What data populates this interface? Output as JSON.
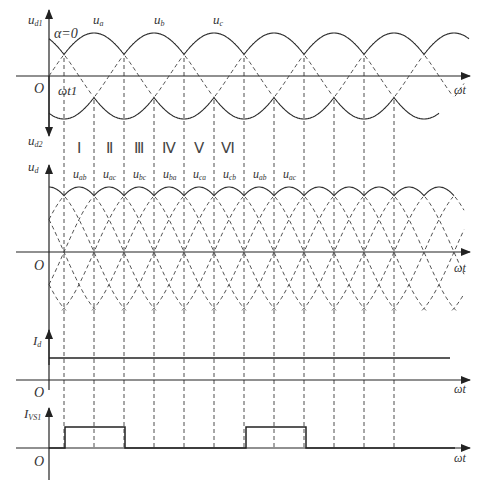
{
  "figure": {
    "panels": [
      {
        "id": "ud1_ud2",
        "y_label_top": "u",
        "y_label_top_sub": "d1",
        "y_label_bottom": "u",
        "y_label_bottom_sub": "d2",
        "origin": "O",
        "x_label": "ωt",
        "alpha_label": "α=0",
        "omega_t1_label": "ωt1",
        "phase_labels": [
          {
            "text": "u",
            "sub": "a"
          },
          {
            "text": "u",
            "sub": "b"
          },
          {
            "text": "u",
            "sub": "c"
          }
        ]
      },
      {
        "id": "ud",
        "y_label": "u",
        "y_label_sub": "d",
        "origin": "O",
        "x_label": "ωt",
        "intervals": [
          "Ⅰ",
          "Ⅱ",
          "Ⅲ",
          "Ⅳ",
          "Ⅴ",
          "Ⅵ"
        ],
        "line_labels": [
          {
            "text": "u",
            "sub": "ab"
          },
          {
            "text": "u",
            "sub": "ac"
          },
          {
            "text": "u",
            "sub": "bc"
          },
          {
            "text": "u",
            "sub": "ba"
          },
          {
            "text": "u",
            "sub": "ca"
          },
          {
            "text": "u",
            "sub": "cb"
          },
          {
            "text": "u",
            "sub": "ab"
          },
          {
            "text": "u",
            "sub": "ac"
          }
        ]
      },
      {
        "id": "Id",
        "y_label": "I",
        "y_label_sub": "d",
        "origin": "O",
        "x_label": "ωt"
      },
      {
        "id": "IVS1",
        "y_label": "I",
        "y_label_sub": "VS1",
        "origin": "O",
        "x_label": "ωt"
      }
    ]
  },
  "geometry": {
    "x0": 49,
    "px_per_deg": 0.5,
    "axis1_y": 76,
    "amp1": 43,
    "axis2_y": 252,
    "amp2": 65,
    "axis3_y": 380,
    "id_level_y": 358,
    "axis4_y": 448,
    "pulse_top_y": 427,
    "dashed_x": [
      64,
      94,
      124,
      154,
      184,
      214,
      244,
      274,
      304,
      334,
      364,
      394
    ],
    "pulses": [
      [
        65,
        125
      ],
      [
        246,
        306
      ]
    ]
  },
  "colors": {
    "line": "#2a2a2a",
    "dash": "#3a3a3a",
    "text": "#333333"
  }
}
